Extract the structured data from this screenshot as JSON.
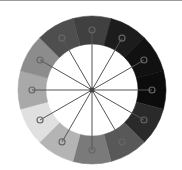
{
  "diagram": {
    "type": "grayscale-color-wheel",
    "center": [
      92,
      90
    ],
    "outer_radius": 74,
    "inner_radius": 46,
    "marker_radius": 60,
    "spoke_color": "#555555",
    "hub_color": "#444444",
    "segments": [
      {
        "angle": 0,
        "color": "#404040"
      },
      {
        "angle": 30,
        "color": "#1c1c1c"
      },
      {
        "angle": 60,
        "color": "#111111"
      },
      {
        "angle": 90,
        "color": "#0c0c0c"
      },
      {
        "angle": 120,
        "color": "#2a2a2a"
      },
      {
        "angle": 150,
        "color": "#585858"
      },
      {
        "angle": 180,
        "color": "#7a7a7a"
      },
      {
        "angle": 210,
        "color": "#b4b4b4"
      },
      {
        "angle": 240,
        "color": "#e0e0e0"
      },
      {
        "angle": 270,
        "color": "#a9a9a9"
      },
      {
        "angle": 300,
        "color": "#8c8c8c"
      },
      {
        "angle": 330,
        "color": "#4e4e4e"
      }
    ]
  }
}
